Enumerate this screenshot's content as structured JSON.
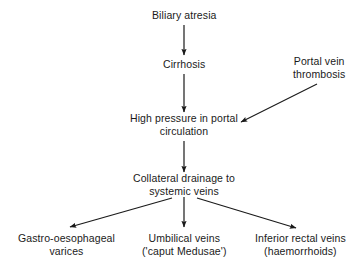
{
  "diagram": {
    "background_color": "#ffffff",
    "text_color": "#1a1a1a",
    "edge_color": "#1a1a1a",
    "nodes": [
      {
        "id": "biliary-atresia",
        "lines": [
          "Biliary atresia"
        ],
        "cx": 184,
        "cy": 15
      },
      {
        "id": "cirrhosis",
        "lines": [
          "Cirrhosis"
        ],
        "cx": 184,
        "cy": 64
      },
      {
        "id": "portal-vein-thrombosis",
        "lines": [
          "Portal vein",
          "thrombosis"
        ],
        "cx": 319,
        "cy": 67
      },
      {
        "id": "high-pressure-portal-circulation",
        "lines": [
          "High pressure in portal",
          "circulation"
        ],
        "cx": 184,
        "cy": 124
      },
      {
        "id": "collateral-drainage-systemic-veins",
        "lines": [
          "Collateral drainage to",
          "systemic veins"
        ],
        "cx": 184,
        "cy": 184
      },
      {
        "id": "gastro-oesophageal-varices",
        "lines": [
          "Gastro-oesophageal",
          "varices"
        ],
        "cx": 66,
        "cy": 244
      },
      {
        "id": "umbilical-veins",
        "lines": [
          "Umbilical veins",
          "('caput Medusae')"
        ],
        "cx": 184,
        "cy": 244
      },
      {
        "id": "inferior-rectal-veins",
        "lines": [
          "Inferior rectal veins",
          "(haemorrhoids)"
        ],
        "cx": 300,
        "cy": 244
      }
    ],
    "edges": [
      {
        "id": "biliary-atresia-to-cirrhosis",
        "from": "biliary-atresia",
        "to": "cirrhosis",
        "x1": 184,
        "y1": 25,
        "x2": 184,
        "y2": 55
      },
      {
        "id": "cirrhosis-to-high-pressure",
        "from": "cirrhosis",
        "to": "high-pressure-portal-circulation",
        "x1": 184,
        "y1": 74,
        "x2": 184,
        "y2": 112
      },
      {
        "id": "portal-vein-thrombosis-to-high-pressure",
        "from": "portal-vein-thrombosis",
        "to": "high-pressure-portal-circulation",
        "x1": 317,
        "y1": 84,
        "x2": 241,
        "y2": 122
      },
      {
        "id": "high-pressure-to-collateral-drainage",
        "from": "high-pressure-portal-circulation",
        "to": "collateral-drainage-systemic-veins",
        "x1": 184,
        "y1": 141,
        "x2": 184,
        "y2": 172
      },
      {
        "id": "collateral-drainage-to-gastro-oesophageal-varices",
        "from": "collateral-drainage-systemic-veins",
        "to": "gastro-oesophageal-varices",
        "x1": 172,
        "y1": 198,
        "x2": 70,
        "y2": 227
      },
      {
        "id": "collateral-drainage-to-umbilical-veins",
        "from": "collateral-drainage-systemic-veins",
        "to": "umbilical-veins",
        "x1": 184,
        "y1": 197,
        "x2": 184,
        "y2": 227
      },
      {
        "id": "collateral-drainage-to-inferior-rectal-veins",
        "from": "collateral-drainage-systemic-veins",
        "to": "inferior-rectal-veins",
        "x1": 197,
        "y1": 198,
        "x2": 296,
        "y2": 228
      }
    ]
  }
}
